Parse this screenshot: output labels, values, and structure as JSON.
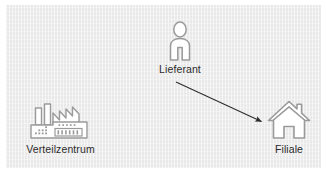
{
  "diagram": {
    "background_color": "#e9e9e9",
    "page_color": "#ffffff",
    "icon_stroke_color": "#9a9a9a",
    "icon_fill_color": "#ffffff",
    "label_color": "#2b2b2b",
    "arrow_color": "#2d2d2d",
    "nodes": [
      {
        "id": "verteilzentrum",
        "label": "Verteilzentrum",
        "icon": "factory-icon"
      },
      {
        "id": "lieferant",
        "label": "Lieferant",
        "icon": "person-icon"
      },
      {
        "id": "filiale",
        "label": "Filiale",
        "icon": "house-icon"
      }
    ],
    "connections": [
      {
        "id": "lieferant-to-filiale",
        "from": "lieferant",
        "to": "filiale",
        "style": "solid-arrow",
        "label": ""
      }
    ]
  }
}
